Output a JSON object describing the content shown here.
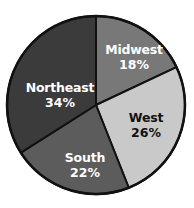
{
  "chart_data": {
    "type": "pie",
    "title": "",
    "subtitle": "",
    "xlabel": "",
    "ylabel": "",
    "legend_position": "none",
    "grid": false,
    "start_angle_deg": 0,
    "direction": "clockwise",
    "categories": [
      "Midwest",
      "West",
      "South",
      "Northeast"
    ],
    "values": [
      18,
      26,
      22,
      34
    ],
    "value_unit": "%",
    "slices": [
      {
        "label": "Midwest",
        "value": 18,
        "value_text": "18%",
        "color": "#787878",
        "text_color": "#ffffff",
        "start_deg": 0,
        "end_deg": 64.8,
        "label_x": 134,
        "label_y": 50,
        "value_x": 134,
        "value_y": 65
      },
      {
        "label": "West",
        "value": 26,
        "value_text": "26%",
        "color": "#c9c9c9",
        "text_color": "#111111",
        "start_deg": 64.8,
        "end_deg": 158.4,
        "label_x": 146,
        "label_y": 118,
        "value_x": 146,
        "value_y": 133
      },
      {
        "label": "South",
        "value": 22,
        "value_text": "22%",
        "color": "#5c5c5c",
        "text_color": "#ffffff",
        "start_deg": 158.4,
        "end_deg": 237.6,
        "label_x": 85,
        "label_y": 158,
        "value_x": 85,
        "value_y": 173
      },
      {
        "label": "Northeast",
        "value": 34,
        "value_text": "34%",
        "color": "#3b3b3b",
        "text_color": "#ffffff",
        "start_deg": 237.6,
        "end_deg": 360,
        "label_x": 60,
        "label_y": 88,
        "value_x": 60,
        "value_y": 103
      }
    ],
    "colors": {
      "midwest": "#787878",
      "west": "#c9c9c9",
      "south": "#5c5c5c",
      "northeast": "#3b3b3b",
      "outline": "#111111",
      "background": "#ffffff"
    },
    "geometry": {
      "center_x": 96,
      "center_y": 105,
      "radius": 89
    }
  }
}
